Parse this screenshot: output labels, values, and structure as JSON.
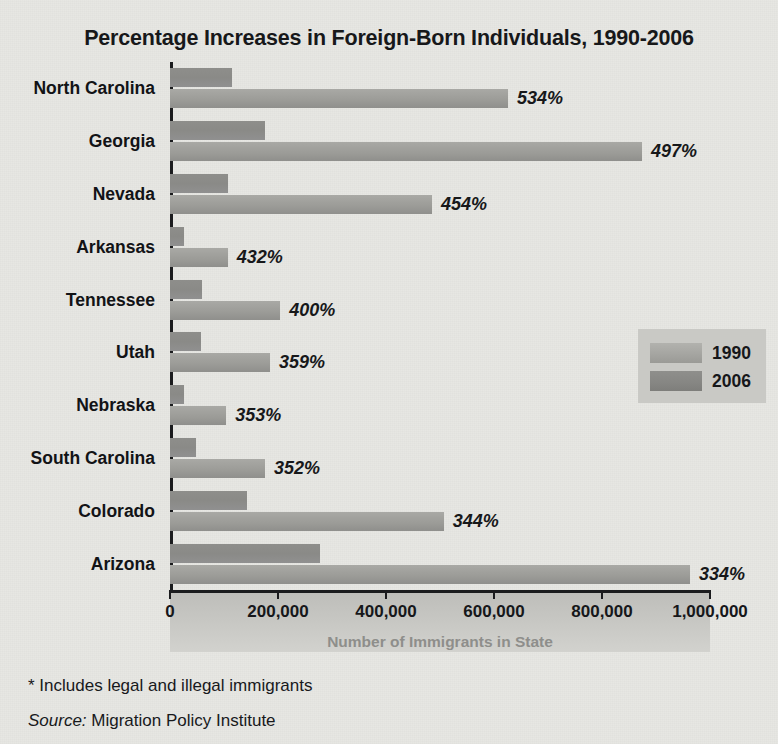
{
  "chart_data": {
    "type": "bar",
    "orientation": "horizontal",
    "title": "Percentage Increases in Foreign-Born Individuals, 1990-2006",
    "xlabel": "Number of Immigrants in State",
    "ylabel": "",
    "xlim": [
      0,
      1000000
    ],
    "xticks": [
      "0",
      "200,000",
      "400,000",
      "600,000",
      "800,000",
      "1,000,000"
    ],
    "xtick_values": [
      0,
      200000,
      400000,
      600000,
      800000,
      1000000
    ],
    "grid": false,
    "legend_position": "middle-right",
    "categories": [
      "North Carolina",
      "Georgia",
      "Nevada",
      "Arkansas",
      "Tennessee",
      "Utah",
      "Nebraska",
      "South Carolina",
      "Colorado",
      "Arizona"
    ],
    "series": [
      {
        "name": "1990",
        "color": "#8c8c89",
        "values": [
          115000,
          176000,
          107000,
          25000,
          59000,
          58000,
          26000,
          49000,
          142000,
          278000
        ]
      },
      {
        "name": "2006",
        "color": "#9d9d99",
        "values": [
          626000,
          874000,
          485000,
          107000,
          204000,
          185000,
          104000,
          176000,
          507000,
          963000
        ]
      }
    ],
    "annotations": [
      "534%",
      "497%",
      "454%",
      "432%",
      "400%",
      "359%",
      "353%",
      "352%",
      "344%",
      "334%"
    ],
    "colors": {
      "background": "#e7e7e3",
      "axis": "#1b1c1e",
      "title_text": "#17181a",
      "axis_band": "#c6c6c2",
      "axis_title_text": "#8e8e8b",
      "legend_background": "#c9c9c5"
    }
  },
  "footnotes": {
    "note": "* Includes legal and illegal immigrants",
    "source_label": "Source:",
    "source_value": " Migration Policy Institute"
  }
}
